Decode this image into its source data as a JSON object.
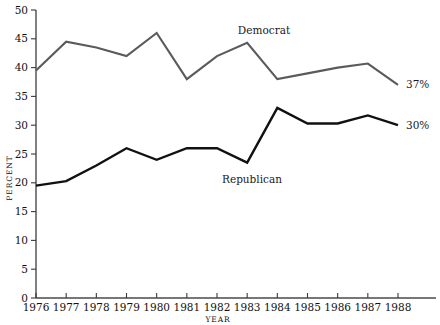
{
  "chart_data": {
    "type": "line",
    "title": "",
    "xlabel": "YEAR",
    "ylabel": "PERCENT",
    "x": [
      1976,
      1977,
      1978,
      1979,
      1980,
      1981,
      1982,
      1983,
      1984,
      1985,
      1986,
      1987,
      1988
    ],
    "xtick_labels": [
      "1976",
      "1977",
      "1978",
      "1979",
      "1980",
      "1981",
      "1982",
      "1983",
      "1984",
      "1985",
      "1986",
      "1987",
      "1988"
    ],
    "ytick_labels": [
      "0",
      "5",
      "10",
      "15",
      "20",
      "25",
      "30",
      "35",
      "40",
      "45",
      "50"
    ],
    "yticks": [
      0,
      5,
      10,
      15,
      20,
      25,
      30,
      35,
      40,
      45,
      50
    ],
    "xlim": [
      1976,
      1988
    ],
    "ylim": [
      0,
      50
    ],
    "grid": false,
    "legend_position": "inline-annotation",
    "series": [
      {
        "name": "Democrat",
        "color": "#5b5b5b",
        "label_text": "Democrat",
        "end_label": "37%",
        "values": [
          39.5,
          44.5,
          43.5,
          42.0,
          46.0,
          38.0,
          42.0,
          44.3,
          38.0,
          39.0,
          40.0,
          40.7,
          37.0
        ]
      },
      {
        "name": "Republican",
        "color": "#111111",
        "label_text": "Republican",
        "end_label": "30%",
        "values": [
          19.5,
          20.3,
          23.0,
          26.0,
          24.0,
          26.0,
          26.0,
          23.5,
          33.0,
          30.3,
          30.3,
          31.7,
          30.0
        ]
      }
    ]
  }
}
